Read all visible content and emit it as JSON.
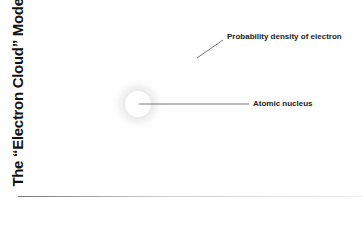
{
  "title": "The “Electron Cloud” Model",
  "labels": {
    "cloud": "Probability density of electron",
    "nucleus": "Atomic nucleus"
  },
  "colors": {
    "text": "#222222",
    "leader_line": "#555555",
    "cloud": "#e0e0e0",
    "background": "#ffffff"
  }
}
